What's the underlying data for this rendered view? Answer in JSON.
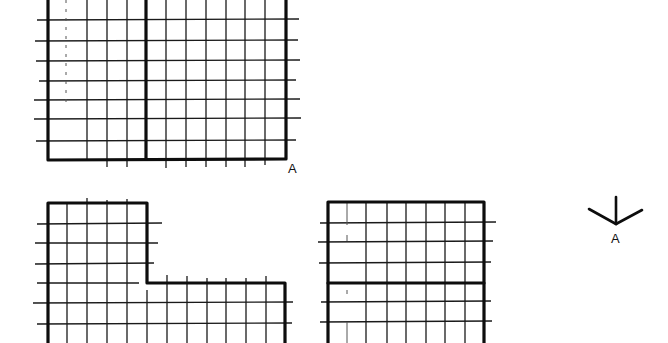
{
  "figure": {
    "grid_spacing_px": 20,
    "views": [
      {
        "name": "top-view",
        "outline": "rectangle with vertical dividing line",
        "label": "A"
      },
      {
        "name": "front-view",
        "outline": "L-shape (tall left block, lower right block)"
      },
      {
        "name": "side-view",
        "outline": "square with horizontal dividing line"
      }
    ],
    "view_direction": {
      "symbol": "arrow-direction-A",
      "label": "A"
    },
    "labels": {
      "top_view_corner": "A",
      "arrow": "A"
    },
    "colors": {
      "line": "#0d0d0d",
      "background": "#ffffff"
    }
  }
}
